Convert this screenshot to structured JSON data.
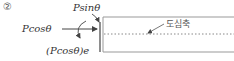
{
  "figure": {
    "number_label": "②",
    "forces": {
      "vertical": "Psinθ",
      "axial": "Pcosθ",
      "moment": "(Pcosθ)e"
    },
    "axis_label": "도심축"
  },
  "colors": {
    "line": "#555555",
    "beam_edge": "#999999",
    "dashed": "#888888",
    "text": "#333333"
  }
}
